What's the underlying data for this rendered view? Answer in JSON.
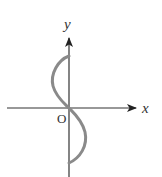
{
  "diagram": {
    "type": "coordinate-sketch",
    "axes": {
      "x_label": "x",
      "y_label": "y",
      "origin_label": "O"
    },
    "curve": {
      "description": "S-shaped curve through the origin: bulges left above the x-axis, right below it, endpoints on the y-axis",
      "color": "#8a8a8a"
    },
    "axis_color": "#333333"
  }
}
